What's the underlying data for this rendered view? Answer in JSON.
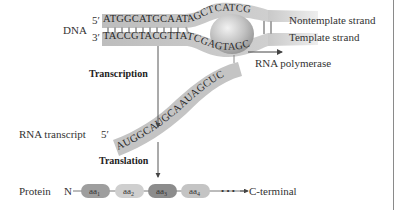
{
  "dna": {
    "label": "DNA",
    "top_prime": "5′",
    "bottom_prime": "3′",
    "nontemplate_sequence": "ATGGCATGCAATAGCTCATCG",
    "template_sequence": "TACCGTACGTTATCGAGTAGC",
    "nontemplate_label": "Nontemplate strand",
    "template_label": "Template strand"
  },
  "polymerase": {
    "label": "RNA polymerase"
  },
  "transcription": {
    "label": "Transcription"
  },
  "rna": {
    "label": "RNA transcript",
    "prime": "5′",
    "sequence": "AUGGCAUGCAAUAGCUC"
  },
  "translation": {
    "label": "Translation"
  },
  "protein": {
    "label": "Protein",
    "n_terminal": "N",
    "amino_acids": [
      {
        "base": "aa",
        "sub": "1",
        "color": "#9e9e9e"
      },
      {
        "base": "aa",
        "sub": "2",
        "color": "#cfcfcf"
      },
      {
        "base": "aa",
        "sub": "3",
        "color": "#8c8c8c"
      },
      {
        "base": "aa",
        "sub": "4",
        "color": "#c4c4c4"
      }
    ],
    "ellipsis": "• • •",
    "c_terminal": "C-terminal"
  },
  "colors": {
    "strand_fill": "#c9c9c9",
    "strand_dark": "#a8a8a8",
    "polymerase_fill": "#bdbdbd",
    "text": "#333333",
    "arrow": "#444444"
  }
}
